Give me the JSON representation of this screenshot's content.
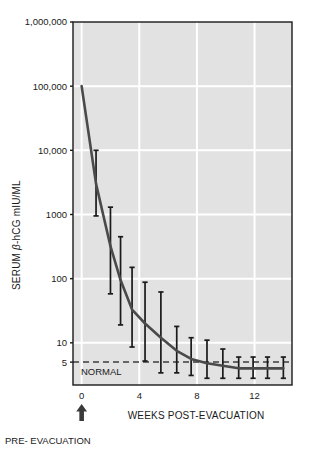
{
  "chart_data": {
    "type": "line",
    "title": "",
    "subtitle": "",
    "xlabel": "WEEKS POST-EVACUATION",
    "ylabel": "SERUM β-hCG mIU/ML",
    "ylabel_parts": {
      "prefix": "SERUM ",
      "beta": "β",
      "suffix": "-hCG mIU/ML"
    },
    "yscale": "log",
    "ylim": [
      2.2,
      1000000
    ],
    "xlim": [
      -0.6,
      14.6
    ],
    "grid": true,
    "grid_color": "#ffffff",
    "plot_background": "#e2e2e2",
    "legend_position": "none",
    "series_color": "#4a4a4a",
    "errorbar_color": "#1a1a1a",
    "x_ticks": [
      0,
      4,
      8,
      12
    ],
    "x_tick_labels": [
      "0",
      "4",
      "8",
      "12"
    ],
    "y_ticks": [
      1000000,
      100000,
      10000,
      1000,
      100,
      10,
      5
    ],
    "y_tick_labels": [
      "1,000,000",
      "100,000",
      "10,000",
      "1000",
      "100",
      "10",
      "5"
    ],
    "y_gridlines": [
      100000,
      10000,
      1000,
      100,
      10
    ],
    "series": [
      {
        "name": "Serum β-hCG regression",
        "x": [
          0,
          1,
          2,
          2.7,
          3.5,
          4.4,
          5.5,
          6.6,
          7.6,
          8.7,
          9.8,
          10.9,
          11.9,
          12.9,
          14.0
        ],
        "values": [
          100000,
          3000,
          320,
          95,
          33,
          20,
          12,
          7.5,
          5.6,
          4.8,
          4.4,
          4.0,
          4.0,
          4.0,
          4.0
        ],
        "err_low": [
          null,
          950,
          58,
          19,
          8.6,
          5.2,
          3.4,
          3.4,
          3.1,
          2.8,
          2.8,
          2.8,
          2.8,
          2.8,
          2.8
        ],
        "err_high": [
          null,
          10000,
          1300,
          450,
          150,
          88,
          62,
          18,
          12,
          11,
          8.0,
          6.0,
          6.0,
          6.0,
          6.0
        ]
      }
    ],
    "reference_line": {
      "label": "NORMAL",
      "value": 5,
      "style": "dashed",
      "color": "#666666"
    },
    "annotations": [
      {
        "name": "pre-evacuation-marker",
        "text": "PRE- EVACUATION",
        "x": 0,
        "marker": "up-arrow"
      }
    ]
  }
}
